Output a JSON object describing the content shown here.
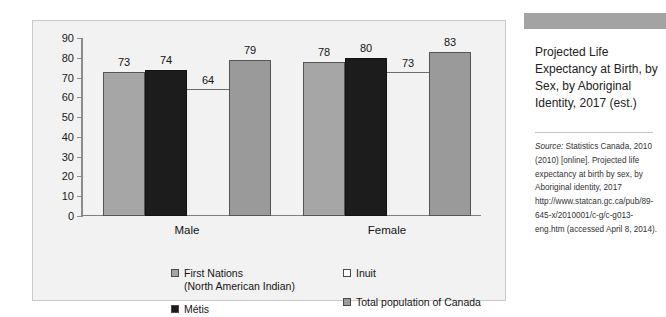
{
  "chart_data": {
    "type": "bar",
    "title": "Projected Life Expectancy at Birth, by Sex, by Aboriginal Identity, 2017 (est.)",
    "xlabel": "",
    "ylabel": "",
    "ylim": [
      0,
      90
    ],
    "yticks": [
      90,
      80,
      70,
      60,
      50,
      40,
      30,
      20,
      10,
      0
    ],
    "grid": false,
    "legend_position": "bottom",
    "categories": [
      "Male",
      "Female"
    ],
    "series": [
      {
        "name": "First Nations\n(North American Indian)",
        "values": [
          73,
          78
        ],
        "color": "#a6a6a6"
      },
      {
        "name": "Métis",
        "values": [
          74,
          80
        ],
        "color": "#1c1c1c"
      },
      {
        "name": "Inuit",
        "values": [
          64,
          73
        ],
        "color": "#ffffff"
      },
      {
        "name": "Total population of Canada",
        "values": [
          79,
          83
        ],
        "color": "#9a9a9a"
      }
    ]
  },
  "legend": {
    "items": [
      {
        "label": "First Nations\n(North American Indian)",
        "swatch": "sw-light"
      },
      {
        "label": "Métis",
        "swatch": "sw-dark"
      },
      {
        "label": "Inuit",
        "swatch": "sw-white"
      },
      {
        "label": "Total population of Canada",
        "swatch": "sw-mid"
      }
    ]
  },
  "figure": {
    "header": "FIGURE 15.2",
    "title": "Projected Life Expectancy at Birth, by Sex, by Aboriginal Identity, 2017 (est.)",
    "source_label": "Source:",
    "source_text": " Statistics Canada, 2010 (2010) [online]. Projected life expectancy at birth by sex, by Aboriginal identity, 2017 http://www.statcan.gc.ca/pub/89-645-x/2010001/c-g/c-g013-eng.htm (accessed April 8, 2014)."
  }
}
